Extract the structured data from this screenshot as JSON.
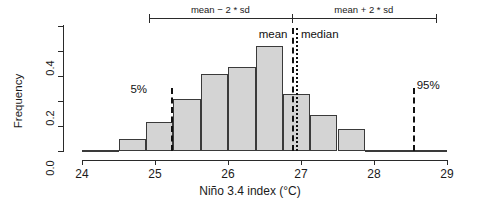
{
  "chart_data": {
    "type": "bar",
    "title": "",
    "xlabel": "Niño 3.4 index (°C)",
    "ylabel": "Frequency",
    "xlim": [
      24,
      29
    ],
    "ylim": [
      0.0,
      0.5
    ],
    "grid": false,
    "bin_width": 0.25,
    "x_ticks": [
      "24",
      "25",
      "26",
      "27",
      "28",
      "29"
    ],
    "x_tick_values": [
      24,
      25,
      26,
      27,
      28,
      29
    ],
    "y_ticks": [
      "0.0",
      "0.2",
      "0.4"
    ],
    "y_tick_values": [
      0.0,
      0.2,
      0.4
    ],
    "y_minor_ticks": [
      0.1,
      0.3,
      0.5
    ],
    "bin_edges": [
      24.0,
      24.5,
      24.75,
      25.0,
      25.25,
      25.5,
      25.75,
      26.0,
      26.25,
      26.5,
      26.75,
      27.0,
      27.25,
      27.5,
      27.75,
      28.0,
      28.25,
      28.5,
      28.75,
      29.0
    ],
    "bars": [
      {
        "x0": 24.0,
        "x1": 24.5,
        "height": 0.005
      },
      {
        "x0": 24.5,
        "x1": 24.88,
        "height": 0.05
      },
      {
        "x0": 24.88,
        "x1": 25.25,
        "height": 0.115
      },
      {
        "x0": 25.25,
        "x1": 25.63,
        "height": 0.21
      },
      {
        "x0": 25.63,
        "x1": 26.0,
        "height": 0.31
      },
      {
        "x0": 26.0,
        "x1": 26.38,
        "height": 0.335
      },
      {
        "x0": 26.38,
        "x1": 26.75,
        "height": 0.42
      },
      {
        "x0": 26.75,
        "x1": 27.13,
        "height": 0.23
      },
      {
        "x0": 27.13,
        "x1": 27.5,
        "height": 0.145
      },
      {
        "x0": 27.5,
        "x1": 27.88,
        "height": 0.09
      },
      {
        "x0": 27.88,
        "x1": 29.0,
        "height": 0.005
      }
    ],
    "annotations": [
      {
        "name": "mean",
        "label": "mean",
        "value": 26.87,
        "style": "dashed"
      },
      {
        "name": "median",
        "label": "median",
        "value": 26.93,
        "style": "dotted"
      },
      {
        "name": "p05",
        "label": "5%",
        "value": 25.22,
        "style": "dash-dot"
      },
      {
        "name": "p95",
        "label": "95%",
        "value": 28.53,
        "style": "dash-dot"
      }
    ],
    "brackets": [
      {
        "name": "mean-minus-2sd",
        "label": "mean − 2 * sd",
        "from": 24.92,
        "to": 26.87
      },
      {
        "name": "mean-plus-2sd",
        "label": "mean + 2 * sd",
        "from": 26.87,
        "to": 28.85
      }
    ],
    "colors": {
      "bar_fill": "#d4d4d4",
      "bar_stroke": "#3a3a3a",
      "axis": "#2a2a2a",
      "annotation": "#111111",
      "background": "#ffffff"
    }
  }
}
